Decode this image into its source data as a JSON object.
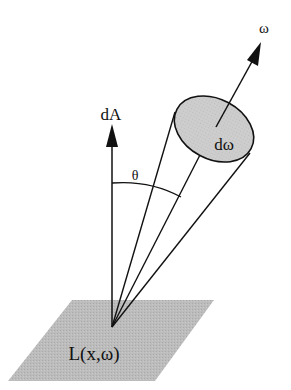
{
  "figure": {
    "type": "radiance-geometry-diagram",
    "labels": {
      "normal": "dA",
      "angle": "θ",
      "solid_angle": "dω",
      "direction": "ω",
      "radiance": "L(x,ω)"
    },
    "colors": {
      "surface_fill": "#b9b9b9",
      "ellipse_fill": "#c8c8c8",
      "stroke": "#111111",
      "background": "#ffffff"
    }
  }
}
